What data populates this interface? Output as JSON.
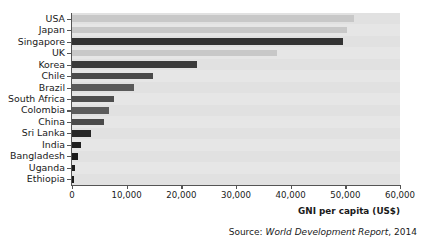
{
  "chart_data": {
    "type": "bar",
    "orientation": "horizontal",
    "title": "",
    "xlabel": "GNI per capita (US$)",
    "ylabel": "",
    "xlim": [
      0,
      60000
    ],
    "xticks": [
      0,
      10000,
      20000,
      30000,
      40000,
      50000,
      60000
    ],
    "xticklabels": [
      "0",
      "10,000",
      "20,000",
      "30,000",
      "40,000",
      "50,000",
      "60,000"
    ],
    "grid": false,
    "legend": false,
    "categories": [
      "USA",
      "Japan",
      "Singapore",
      "UK",
      "Korea",
      "Chile",
      "Brazil",
      "South Africa",
      "Colombia",
      "China",
      "Sri Lanka",
      "India",
      "Bangladesh",
      "Uganda",
      "Ethiopia"
    ],
    "values": [
      51600,
      50300,
      49500,
      37500,
      22900,
      14800,
      11400,
      7700,
      6800,
      5800,
      3400,
      1600,
      1100,
      500,
      400
    ],
    "bar_colors": [
      "#c8c8c8",
      "#c8c8c8",
      "#333333",
      "#c8c8c8",
      "#3a3a3a",
      "#4a4a4a",
      "#5a5a5a",
      "#4e4e4e",
      "#5c5c5c",
      "#4a4a4a",
      "#262626",
      "#1f1f1f",
      "#1a1a1a",
      "#1a1a1a",
      "#1a1a1a"
    ],
    "plot_background": "#e6e6e6",
    "axis_color": "#555555"
  },
  "source": {
    "prefix": "Source: ",
    "title": "World Development Report",
    "suffix": ", 2014"
  }
}
